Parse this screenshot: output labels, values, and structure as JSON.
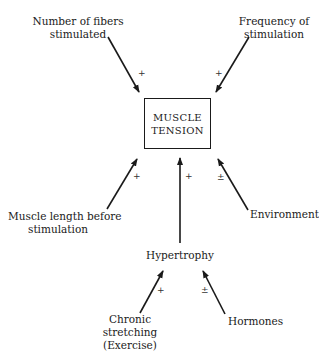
{
  "diagram": {
    "center": {
      "line1": "MUSCLE",
      "line2": "TENSION"
    },
    "factors": {
      "fibers": {
        "line1": "Number of fibers",
        "line2": "stimulated",
        "sign": "+"
      },
      "frequency": {
        "line1": "Frequency of",
        "line2": "stimulation",
        "sign": "+"
      },
      "length": {
        "line1": "Muscle length before",
        "line2": "stimulation",
        "sign": "+"
      },
      "hypertrophy": {
        "label": "Hypertrophy",
        "sign": "+"
      },
      "environment": {
        "label": "Environment",
        "sign": "±"
      }
    },
    "hypertrophy_factors": {
      "stretching": {
        "line1": "Chronic",
        "line2": "stretching",
        "line3": "(Exercise)",
        "sign": "+"
      },
      "hormones": {
        "label": "Hormones",
        "sign": "±"
      }
    }
  }
}
